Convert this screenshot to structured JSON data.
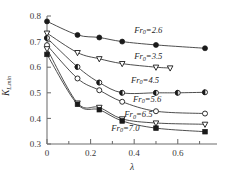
{
  "figure": {
    "name": "k-lambda-froude-curves",
    "background": "#ffffff",
    "line_color": "#2e2e2e",
    "axis_color": "#6d6d6d",
    "text_color": "#1f1f1f"
  },
  "axes": {
    "x": {
      "title": "λ",
      "min": 0,
      "max": 0.78,
      "ticks": [
        0,
        0.2,
        0.4,
        0.6
      ],
      "tick_labels": [
        "0",
        "0.2",
        "0.4",
        "0.6"
      ],
      "minor_ticks": [
        0.1,
        0.3,
        0.5,
        0.7
      ]
    },
    "y": {
      "title": "K",
      "title_sub": "L,min",
      "min": 0.3,
      "max": 0.8,
      "ticks": [
        0.3,
        0.4,
        0.5,
        0.6,
        0.7,
        0.8
      ],
      "tick_labels": [
        "0.3",
        "0.4",
        "0.5",
        "0.6",
        "0.7",
        "0.8"
      ]
    }
  },
  "chart_data": {
    "type": "line",
    "title": "",
    "subtitle": "",
    "xlabel": "λ",
    "ylabel": "K_L,min",
    "xlim": [
      0,
      0.78
    ],
    "ylim": [
      0.3,
      0.8
    ],
    "grid": false,
    "legend": "inline-curve-labels",
    "annotations": [
      "Fr0=2.6",
      "Fr0=3.5",
      "Fr0=4.5",
      "Fr0=5.6",
      "Fr0=6.5",
      "Fr0=7.0"
    ],
    "series": [
      {
        "name": "Fr0=2.6",
        "label": "Fr",
        "label_sub": "0",
        "label_value": "=2.6",
        "marker": "filled-circle",
        "label_x": 0.4,
        "label_y": 0.735,
        "x": [
          0,
          0.14,
          0.24,
          0.345,
          0.5,
          0.725
        ],
        "y": [
          0.779,
          0.726,
          0.716,
          0.7,
          0.687,
          0.674
        ]
      },
      {
        "name": "Fr0=3.5",
        "label": "Fr",
        "label_sub": "0",
        "label_value": "=3.5",
        "marker": "open-triangle-down",
        "label_x": 0.4,
        "label_y": 0.632,
        "x": [
          0,
          0.14,
          0.24,
          0.345,
          0.5,
          0.565
        ],
        "y": [
          0.733,
          0.657,
          0.633,
          0.614,
          0.6,
          0.597
        ]
      },
      {
        "name": "Fr0=4.5",
        "label": "Fr",
        "label_sub": "0",
        "label_value": "=4.5",
        "marker": "half-filled-circle",
        "label_x": 0.385,
        "label_y": 0.54,
        "x": [
          0,
          0.14,
          0.24,
          0.345,
          0.5,
          0.6,
          0.725
        ],
        "y": [
          0.714,
          0.601,
          0.54,
          0.5,
          0.5,
          0.5,
          0.502
        ]
      },
      {
        "name": "Fr0=5.6",
        "label": "Fr",
        "label_sub": "0",
        "label_value": "=5.6",
        "marker": "open-circle",
        "label_x": 0.395,
        "label_y": 0.466,
        "x": [
          0,
          0.14,
          0.24,
          0.345,
          0.5,
          0.725
        ],
        "y": [
          0.686,
          0.556,
          0.51,
          0.465,
          0.428,
          0.419
        ]
      },
      {
        "name": "Fr0=6.5",
        "label": "Fr",
        "label_sub": "0",
        "label_value": "=6.5",
        "marker": "open-triangle-down",
        "label_x": 0.355,
        "label_y": 0.404,
        "x": [
          0,
          0.14,
          0.24,
          0.345,
          0.5,
          0.725
        ],
        "y": [
          0.672,
          0.46,
          0.443,
          0.398,
          0.382,
          0.377
        ]
      },
      {
        "name": "Fr0=7.0",
        "label": "Fr",
        "label_sub": "0",
        "label_value": "=7.0",
        "marker": "filled-square",
        "label_x": 0.295,
        "label_y": 0.352,
        "x": [
          0,
          0.14,
          0.24,
          0.345,
          0.5,
          0.725
        ],
        "y": [
          0.65,
          0.455,
          0.434,
          0.39,
          0.362,
          0.348
        ]
      }
    ]
  }
}
